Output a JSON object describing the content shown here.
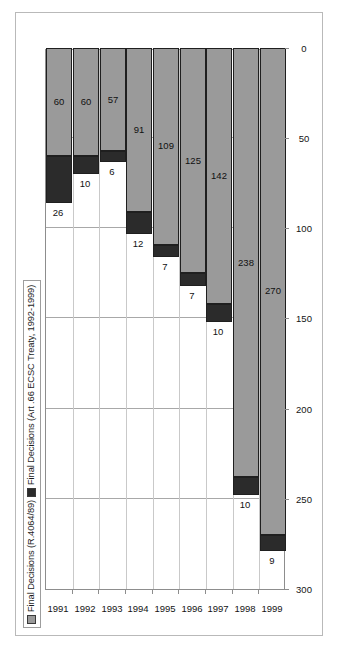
{
  "legend": {
    "entries": [
      {
        "label": "Final Decisions (R.4064/89)",
        "swatch": "grey-square-icon",
        "color": "#9a9a9a"
      },
      {
        "label": "Final Decisions (Art .66 ECSC Treaty, 1992-1999)",
        "swatch": "black-square-icon",
        "color": "#2b2b2b"
      }
    ]
  },
  "chart_data": {
    "type": "bar",
    "orientation": "horizontal",
    "stacked": true,
    "title": "",
    "xlabel": "",
    "ylabel": "",
    "categories": [
      "1991",
      "1992",
      "1993",
      "1994",
      "1995",
      "1996",
      "1997",
      "1998",
      "1999"
    ],
    "series": [
      {
        "name": "Final Decisions (R.4064/89)",
        "color": "#9a9a9a",
        "values": [
          60,
          60,
          57,
          91,
          109,
          125,
          142,
          238,
          270
        ]
      },
      {
        "name": "Final Decisions (Art .66 ECSC Treaty, 1992-1999)",
        "color": "#2b2b2b",
        "values": [
          26,
          10,
          6,
          12,
          7,
          7,
          10,
          10,
          9
        ]
      }
    ],
    "value_axis": {
      "min": 0,
      "max": 300,
      "step": 50,
      "ticks": [
        "0",
        "50",
        "100",
        "150",
        "200",
        "250",
        "300"
      ],
      "reversed": true
    },
    "grid": true,
    "legend_position": "top-left"
  }
}
